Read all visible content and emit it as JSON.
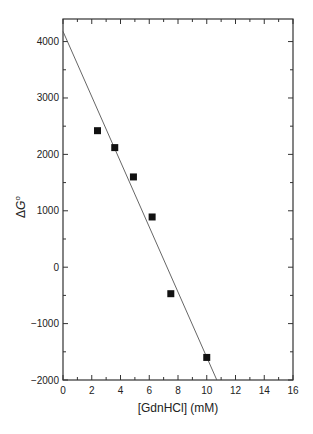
{
  "chart_data": {
    "type": "scatter",
    "title": "",
    "xlabel": "[GdnHCl] (mM)",
    "ylabel": "ΔG°",
    "ylabel_parts": {
      "delta": "Δ",
      "var": "G",
      "sup": "o"
    },
    "xlim": [
      0,
      16
    ],
    "ylim": [
      -2000,
      4400
    ],
    "x_ticks": [
      0,
      2,
      4,
      6,
      8,
      10,
      12,
      14,
      16
    ],
    "y_ticks": [
      -2000,
      -1000,
      0,
      1000,
      2000,
      3000,
      4000
    ],
    "grid": false,
    "legend": null,
    "series": [
      {
        "name": "data",
        "marker": "filled-square",
        "color": "#111111",
        "x": [
          2.4,
          3.6,
          4.9,
          6.2,
          7.5,
          10.0
        ],
        "y": [
          2420,
          2120,
          1600,
          890,
          -470,
          -1600
        ]
      }
    ],
    "fit_line": {
      "name": "linear fit",
      "color": "#555555",
      "x": [
        0,
        10.7
      ],
      "y": [
        4180,
        -2000
      ]
    }
  }
}
